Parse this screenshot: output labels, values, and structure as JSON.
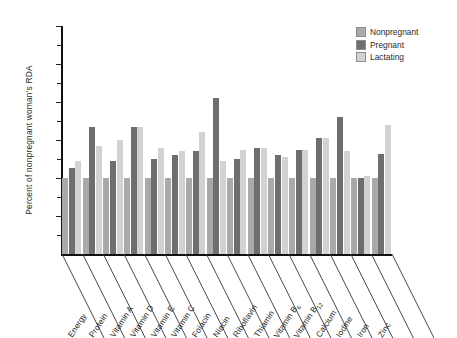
{
  "chart_data": {
    "type": "bar",
    "title": "",
    "subtitle": "",
    "xlabel": "",
    "ylabel": "Percent of nonpregnant woman's RDA",
    "ylim": [
      0,
      300
    ],
    "yticks": [
      0,
      50,
      100,
      150,
      200,
      250,
      300
    ],
    "ytick_labels": [
      "",
      "50",
      "100",
      "150",
      "200",
      "250",
      "300"
    ],
    "minor_ticks": [
      25,
      75,
      125,
      175,
      225,
      275
    ],
    "grid": false,
    "legend_position": "top-right",
    "orientation": "vertical",
    "grouping": "clustered",
    "categories": [
      "Energy",
      "Protein",
      "Vitamin A",
      "Vitamin D",
      "Vitamin E",
      "Vitamin C",
      "Folacin",
      "Niacin",
      "Riboflavin",
      "Thiamin",
      "Vitamin B6",
      "Vitamin B12",
      "Calcium",
      "Iodine",
      "Iron",
      "Zinc"
    ],
    "categories_display": [
      "Energy",
      "Protein",
      "Vitamin A",
      "Vitamin D",
      "Vitamin E",
      "Vitamin C",
      "Folacin",
      "Niacin",
      "Riboflavin",
      "Thiamin",
      "Vitamin B",
      "Vitamin B",
      "Calcium",
      "Iodine",
      "Iron",
      "Zinc"
    ],
    "categories_subscript": [
      "",
      "",
      "",
      "",
      "",
      "",
      "",
      "",
      "",
      "",
      "6",
      "12",
      "",
      "",
      "",
      ""
    ],
    "series": [
      {
        "name": "Nonpregnant",
        "color": "#a9a9a9",
        "values": [
          100,
          100,
          100,
          100,
          100,
          100,
          100,
          100,
          100,
          100,
          100,
          100,
          100,
          100,
          100,
          100
        ]
      },
      {
        "name": "Pregnant",
        "color": "#6e6e6e",
        "values": [
          113,
          167,
          122,
          167,
          125,
          130,
          136,
          205,
          125,
          140,
          130,
          137,
          152,
          180,
          100,
          132
        ]
      },
      {
        "name": "Lactating",
        "color": "#d2d2d2",
        "values": [
          122,
          142,
          150,
          167,
          140,
          135,
          160,
          122,
          137,
          140,
          128,
          137,
          152,
          135,
          103,
          170
        ]
      }
    ]
  },
  "legend": {
    "items": [
      {
        "label": "Nonpregnant",
        "color": "#a9a9a9"
      },
      {
        "label": "Pregnant",
        "color": "#6e6e6e"
      },
      {
        "label": "Lactating",
        "color": "#d2d2d2"
      }
    ]
  },
  "axes": {
    "y_title": "Percent of nonpregnant woman's RDA",
    "y_tick_labels": [
      "300",
      "250",
      "200",
      "150",
      "100",
      "50"
    ]
  }
}
